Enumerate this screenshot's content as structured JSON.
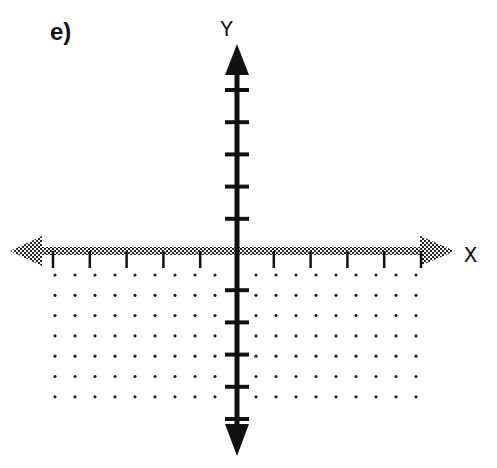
{
  "figure": {
    "label": "e)",
    "x_axis_label": "X",
    "y_axis_label": "Y",
    "colors": {
      "ink": "#111111",
      "dots": "#222222",
      "boundary": "#555555"
    }
  },
  "geometry": {
    "origin": [
      237,
      251
    ],
    "x_tick_spacing": 36.8,
    "y_tick_spacing": 32.2,
    "x_ticks_each_side": 5,
    "y_ticks_above": 5,
    "y_ticks_below": 5,
    "dot_spacing_x": 20,
    "dot_spacing_y": 20.3,
    "dot_rows": 7,
    "dot_cols_left": 9,
    "dot_cols_right": 9
  }
}
